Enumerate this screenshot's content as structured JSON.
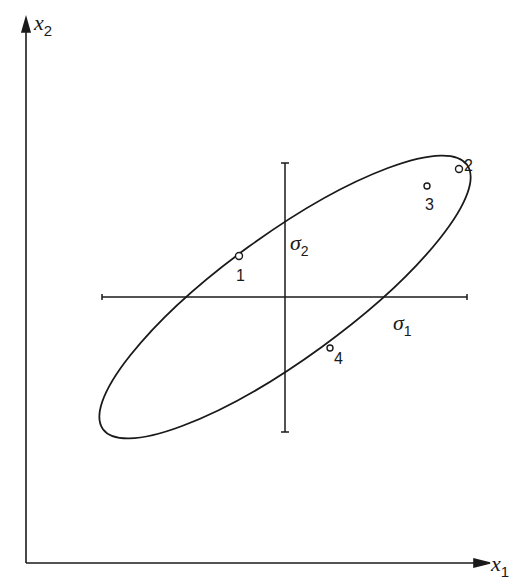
{
  "axes": {
    "x": {
      "label": "x",
      "subscript": "1"
    },
    "y": {
      "label": "x",
      "subscript": "2"
    }
  },
  "principal_axes": {
    "sigma1": {
      "label": "σ",
      "subscript": "1"
    },
    "sigma2": {
      "label": "σ",
      "subscript": "2"
    }
  },
  "points": [
    {
      "id": "1",
      "label": "1"
    },
    {
      "id": "2",
      "label": "2"
    },
    {
      "id": "3",
      "label": "3"
    },
    {
      "id": "4",
      "label": "4"
    }
  ],
  "colors": {
    "ink": "#1a1a1a",
    "background": "#ffffff"
  }
}
